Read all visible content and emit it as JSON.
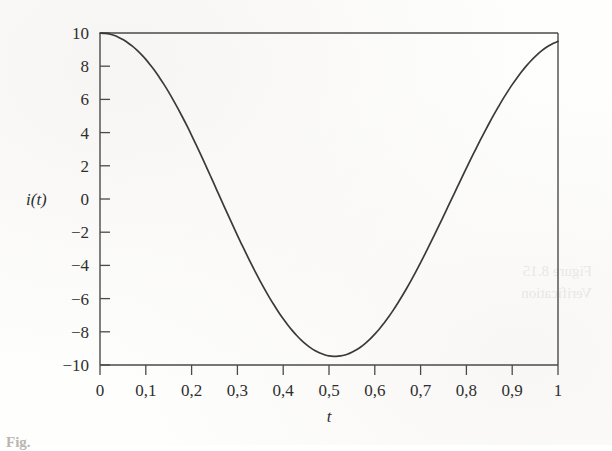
{
  "figure": {
    "y_axis_label": "i(t)",
    "x_axis_label": "t",
    "caption_fragment": "Fig."
  },
  "chart_data": {
    "type": "line",
    "title": "",
    "xlabel": "t",
    "ylabel": "i(t)",
    "xlim": [
      0,
      1
    ],
    "ylim": [
      -10,
      10
    ],
    "grid": false,
    "legend": null,
    "x_tick_labels": [
      "0",
      "0,1",
      "0,2",
      "0,3",
      "0,4",
      "0,5",
      "0,6",
      "0,7",
      "0,8",
      "0,9",
      "1"
    ],
    "x_tick_values": [
      0,
      0.1,
      0.2,
      0.3,
      0.4,
      0.5,
      0.6,
      0.7,
      0.8,
      0.9,
      1
    ],
    "y_tick_labels": [
      "10",
      "8",
      "6",
      "4",
      "2",
      "0",
      "−2",
      "−4",
      "−6",
      "−8",
      "−10"
    ],
    "y_tick_values": [
      10,
      8,
      6,
      4,
      2,
      0,
      -2,
      -4,
      -6,
      -8,
      -10
    ],
    "decimal_separator": ",",
    "line_color": "#3a3a3a",
    "line_width": 1.7,
    "annotations": [],
    "features": {
      "start_point": [
        0,
        10.0
      ],
      "end_point": [
        1,
        9.0
      ],
      "maxima": [
        [
          0.0,
          10.0
        ],
        [
          0.535,
          10.0
        ]
      ],
      "minima": [
        [
          0.285,
          -9.7
        ],
        [
          0.785,
          -9.7
        ]
      ],
      "zero_crossings": [
        0.145,
        0.43,
        0.64,
        0.93
      ],
      "approx_period": 0.5
    },
    "x": [
      0.0,
      0.01,
      0.02,
      0.03,
      0.04,
      0.05,
      0.06,
      0.07,
      0.08,
      0.09,
      0.1,
      0.11,
      0.12,
      0.13,
      0.14,
      0.15,
      0.16,
      0.17,
      0.18,
      0.19,
      0.2,
      0.21,
      0.22,
      0.23,
      0.24,
      0.25,
      0.26,
      0.27,
      0.28,
      0.29,
      0.3,
      0.31,
      0.32,
      0.33,
      0.34,
      0.35,
      0.36,
      0.37,
      0.38,
      0.39,
      0.4,
      0.41,
      0.42,
      0.43,
      0.44,
      0.45,
      0.46,
      0.47,
      0.48,
      0.49,
      0.5,
      0.51,
      0.52,
      0.53,
      0.54,
      0.55,
      0.56,
      0.57,
      0.58,
      0.59,
      0.6,
      0.61,
      0.62,
      0.63,
      0.64,
      0.65,
      0.66,
      0.67,
      0.68,
      0.69,
      0.7,
      0.71,
      0.72,
      0.73,
      0.74,
      0.75,
      0.76,
      0.77,
      0.78,
      0.79,
      0.8,
      0.81,
      0.82,
      0.83,
      0.84,
      0.85,
      0.86,
      0.87,
      0.88,
      0.89,
      0.9,
      0.91,
      0.92,
      0.93,
      0.94,
      0.95,
      0.96,
      0.97,
      0.98,
      0.99,
      1.0
    ],
    "y": [
      10.0,
      9.98,
      9.94,
      9.86,
      9.75,
      9.61,
      9.43,
      9.22,
      8.98,
      8.71,
      8.41,
      8.07,
      7.71,
      7.31,
      6.89,
      6.44,
      5.96,
      5.46,
      4.94,
      4.4,
      3.84,
      3.26,
      2.67,
      2.07,
      1.46,
      0.85,
      0.23,
      -0.38,
      -0.99,
      -1.59,
      -2.19,
      -2.77,
      -3.34,
      -3.9,
      -4.44,
      -4.96,
      -5.46,
      -5.94,
      -6.39,
      -6.82,
      -7.22,
      -7.59,
      -7.93,
      -8.24,
      -8.52,
      -8.76,
      -8.97,
      -9.14,
      -9.28,
      -9.38,
      -9.45,
      -9.48,
      -9.47,
      -9.43,
      -9.35,
      -9.23,
      -9.08,
      -8.9,
      -8.68,
      -8.43,
      -8.14,
      -7.83,
      -7.48,
      -7.11,
      -6.71,
      -6.28,
      -5.83,
      -5.36,
      -4.87,
      -4.36,
      -3.83,
      -3.29,
      -2.74,
      -2.18,
      -1.61,
      -1.03,
      -0.45,
      0.13,
      0.71,
      1.29,
      1.86,
      2.43,
      2.98,
      3.53,
      4.06,
      4.58,
      5.08,
      5.56,
      6.03,
      6.47,
      6.89,
      7.28,
      7.65,
      7.99,
      8.3,
      8.58,
      8.83,
      9.05,
      9.23,
      9.38,
      9.5
    ]
  }
}
